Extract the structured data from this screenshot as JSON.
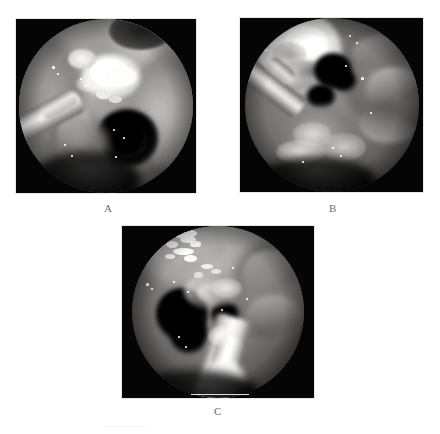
{
  "figure": {
    "background_color": "#ffffff",
    "width": 440,
    "height": 434,
    "label_color": "#6d6d6d",
    "panel_background": "#050505",
    "caption_partial_text": "......................"
  },
  "panels": [
    {
      "id": "A",
      "label": "A",
      "modality": "endoscopic photograph",
      "frame": {
        "x": 16,
        "y": 19,
        "width": 180,
        "height": 174
      },
      "label_position": {
        "x": 104,
        "y": 203
      },
      "description": "Endoscopic view with bright white lesion upper centre, metallic instrument shaft entering from lower left, dark cavity lower right",
      "features": [
        "bright-white-lesion",
        "instrument-shaft",
        "dark-cavity",
        "mucosa-folds"
      ]
    },
    {
      "id": "B",
      "label": "B",
      "modality": "endoscopic photograph",
      "frame": {
        "x": 240,
        "y": 18,
        "width": 183,
        "height": 174
      },
      "label_position": {
        "x": 329,
        "y": 203
      },
      "description": "Endoscopic view with large bright mass occupying upper left field, instrument shaft entering from left, textured tissue across lower field",
      "features": [
        "bright-mass",
        "instrument-shaft",
        "tissue-folds",
        "dark-recess"
      ]
    },
    {
      "id": "C",
      "label": "C",
      "modality": "endoscopic photograph",
      "frame": {
        "x": 122,
        "y": 226,
        "width": 192,
        "height": 172
      },
      "label_position": {
        "x": 214,
        "y": 406
      },
      "description": "Endoscopic view with bright instrument tip entering from bottom centre, bright speckled tissue upper left, darker recess left of centre",
      "features": [
        "instrument-tip",
        "bright-speckles",
        "tissue-folds",
        "dark-recess"
      ]
    }
  ]
}
